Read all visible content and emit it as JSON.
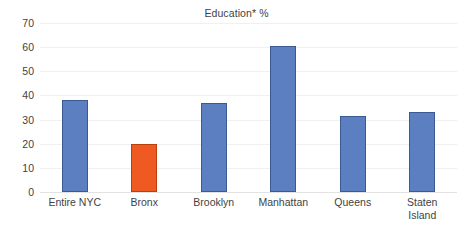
{
  "chart_data": {
    "type": "bar",
    "title": "Education* %",
    "xlabel": "",
    "ylabel": "",
    "categories": [
      "Entire NYC",
      "Bronx",
      "Brooklyn",
      "Manhattan",
      "Queens",
      "Staten\nIsland"
    ],
    "values": [
      38,
      20,
      37,
      60.5,
      31.5,
      33
    ],
    "bar_colors": [
      "#5b7fc0",
      "#ee5a21",
      "#5b7fc0",
      "#5b7fc0",
      "#5b7fc0",
      "#5b7fc0"
    ],
    "highlight_category": "Bronx",
    "highlight_color": "#ee5a21",
    "series_color": "#5b7fc0",
    "ylim": [
      0,
      70
    ],
    "ytick_values": [
      0,
      10,
      20,
      30,
      40,
      50,
      60,
      70
    ],
    "ytick_labels": [
      "0",
      "10",
      "20",
      "30",
      "40",
      "50",
      "60",
      "70"
    ],
    "grid": true,
    "grid_axis": "y",
    "grid_color": "#f0f0f0",
    "legend": false,
    "legend_position": "none",
    "background_color": "#ffffff",
    "text_color": "#3f3f3f"
  }
}
